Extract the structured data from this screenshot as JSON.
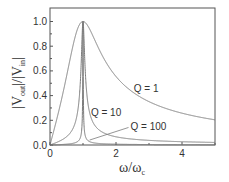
{
  "chart_data": {
    "type": "line",
    "title": "",
    "xlabel": "ω/ω_c",
    "ylabel": "|V_out|/|V_in|",
    "xlim": [
      0,
      5
    ],
    "ylim": [
      0,
      1.05
    ],
    "xticks": [
      0,
      2,
      4
    ],
    "xtick_labels": [
      "0",
      "2",
      "4"
    ],
    "yticks": [
      0.0,
      0.2,
      0.4,
      0.6,
      0.8,
      1.0
    ],
    "ytick_labels": [
      "0.0",
      "0.2",
      "0.4",
      "0.6",
      "0.8",
      "1.0"
    ],
    "grid": false,
    "legend": "none (inline annotations)",
    "model": "|H| = 1 / sqrt(1 + Q^2 (x - 1/x)^2)",
    "series": [
      {
        "name": "Q = 1",
        "Q": 1,
        "x": [
          0,
          0.5,
          1,
          1.5,
          2,
          3,
          4,
          5
        ],
        "values": [
          0,
          0.55,
          1.0,
          0.77,
          0.55,
          0.35,
          0.26,
          0.2
        ]
      },
      {
        "name": "Q = 10",
        "Q": 10,
        "x": [
          0,
          0.5,
          0.9,
          1,
          1.1,
          1.5,
          2,
          3,
          5
        ],
        "values": [
          0,
          0.07,
          0.43,
          1.0,
          0.48,
          0.12,
          0.07,
          0.04,
          0.02
        ]
      },
      {
        "name": "Q = 100",
        "Q": 100,
        "x": [
          0,
          0.5,
          0.99,
          1,
          1.01,
          1.5,
          5
        ],
        "values": [
          0,
          0.007,
          0.45,
          1.0,
          0.45,
          0.012,
          0.002
        ]
      }
    ],
    "annotations": [
      {
        "text": "Q = 1",
        "x": 2.6,
        "y": 0.46
      },
      {
        "text": "Q = 10",
        "x": 1.3,
        "y": 0.27
      },
      {
        "text": "Q = 100",
        "x": 2.5,
        "y": 0.15,
        "arrow_to": [
          1.2,
          0.04
        ]
      }
    ]
  },
  "labels": {
    "xlabel_main": "ω/ω",
    "xlabel_sub": "c",
    "ylabel_pre": "|V",
    "ylabel_sub1": "out",
    "ylabel_mid": "|/|V",
    "ylabel_sub2": "in",
    "ylabel_post": "|"
  },
  "colors": {
    "curve": "#7a7a7a",
    "axis": "#555555",
    "text": "#333333"
  }
}
